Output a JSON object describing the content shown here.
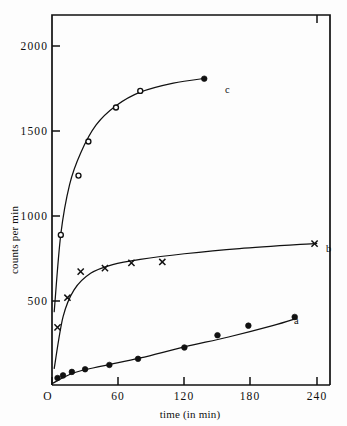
{
  "chart_data": {
    "type": "scatter",
    "title": "",
    "xlabel": "time (in min)",
    "ylabel": "counts per min",
    "xlim": [
      0,
      252
    ],
    "ylim": [
      0,
      2120
    ],
    "grid": false,
    "legend_position": "inline-right-of-curve-ends",
    "xticks": [
      0,
      60,
      120,
      180,
      240
    ],
    "xtick_labels": [
      "O",
      "60",
      "120",
      "180",
      "240"
    ],
    "yticks": [
      500,
      1000,
      1500,
      2000
    ],
    "ytick_labels": [
      "500",
      "1000",
      "1500",
      "2000"
    ],
    "series": [
      {
        "name": "a",
        "label": "a",
        "marker": "filled-circle",
        "x": [
          5,
          10,
          18,
          30,
          52,
          78,
          120,
          150,
          178,
          220
        ],
        "y": [
          40,
          55,
          75,
          90,
          115,
          150,
          215,
          285,
          340,
          390
        ],
        "curve_x": [
          0,
          20,
          45,
          80,
          120,
          160,
          200,
          222
        ],
        "curve_y": [
          8,
          70,
          108,
          155,
          218,
          275,
          340,
          382
        ]
      },
      {
        "name": "b",
        "label": "b",
        "marker": "cross",
        "x": [
          5,
          14,
          26,
          48,
          72,
          100,
          238
        ],
        "y": [
          330,
          500,
          650,
          670,
          700,
          705,
          810
        ],
        "curve_x": [
          2,
          10,
          20,
          35,
          55,
          80,
          120,
          170,
          240
        ],
        "curve_y": [
          95,
          390,
          545,
          640,
          690,
          720,
          752,
          782,
          812
        ]
      },
      {
        "name": "c",
        "label": "c",
        "marker": "open-circle",
        "x": [
          8,
          24,
          33,
          58,
          80,
          138
        ],
        "y": [
          860,
          1200,
          1395,
          1590,
          1685,
          1755
        ],
        "marker_overrides": {
          "138": "filled-circle"
        },
        "curve_x": [
          2,
          8,
          16,
          26,
          40,
          58,
          80,
          110,
          140
        ],
        "curve_y": [
          420,
          865,
          1150,
          1330,
          1490,
          1600,
          1678,
          1730,
          1758
        ]
      }
    ]
  },
  "labels": {
    "y_axis_title": "counts per min",
    "x_axis_title": "time (in min)",
    "curve_a": "a",
    "curve_b": "b",
    "curve_c": "c",
    "y_2000": "2000",
    "y_1500": "1500",
    "y_1000": "1000",
    "y_500": "500",
    "x_0": "O",
    "x_60": "60",
    "x_120": "120",
    "x_180": "180",
    "x_240": "240"
  },
  "colors": {
    "ink": "#111111",
    "background": "#fdfdfd",
    "marker_fill_open": "#ffffff"
  }
}
